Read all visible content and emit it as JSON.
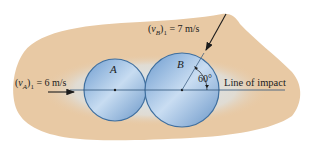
{
  "diagram": {
    "disk_a": {
      "label": "A"
    },
    "disk_b": {
      "label": "B"
    },
    "velocity_a": {
      "label": "(v_A)_1 = 6 m/s",
      "var": "v",
      "sub": "A",
      "index": "1",
      "value": "= 6 m/s"
    },
    "velocity_b": {
      "label": "(v_B)_1 = 7 m/s",
      "var": "v",
      "sub": "B",
      "index": "1",
      "value": "= 7 m/s"
    },
    "angle": {
      "label": "60°"
    },
    "line_of_impact": {
      "label": "Line of impact"
    },
    "colors": {
      "background_blob": "#e8c9a4",
      "disk_fill": "#8fb6de",
      "disk_edge": "#3f6f9f",
      "glow": "#cfe3f6",
      "ink": "#1c1c1c"
    }
  }
}
